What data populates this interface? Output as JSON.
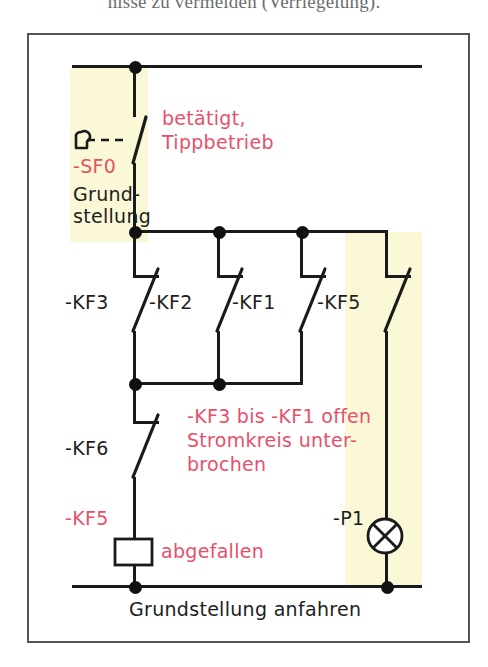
{
  "caption_top": "nisse zu vermeiden (Verriegelung).",
  "diagram": {
    "title_bottom": "Grundstellung anfahren",
    "devices": {
      "sf0": {
        "tag": "-SF0",
        "state_note_line1": "Grund-",
        "state_note_line2": "stellung",
        "annotation_line1": "betätigt,",
        "annotation_line2": "Tippbetrieb",
        "symbol": "pushbutton-no-contact"
      },
      "kf3": {
        "tag": "-KF3",
        "symbol": "no-contact-open"
      },
      "kf2": {
        "tag": "-KF2",
        "symbol": "no-contact-open"
      },
      "kf1": {
        "tag": "-KF1",
        "symbol": "no-contact-open"
      },
      "kf5_contact": {
        "tag": "-KF5",
        "symbol": "no-contact-open"
      },
      "kf6": {
        "tag": "-KF6",
        "symbol": "no-contact-open"
      },
      "kf5_coil": {
        "tag": "-KF5",
        "annotation": "abgefallen",
        "symbol": "relay-coil"
      },
      "p1": {
        "tag": "-P1",
        "symbol": "signal-lamp"
      }
    },
    "annotations": {
      "branch_note_line1": "-KF3 bis -KF1 offen",
      "branch_note_line2": "Stromkreis unter-",
      "branch_note_line3": "brochen"
    },
    "colors": {
      "wire": "#1a1a1a",
      "frame": "#545454",
      "highlight": "#fbf8d8",
      "annotation_red": "#e8506a",
      "label_black": "#1d1d1d"
    }
  }
}
